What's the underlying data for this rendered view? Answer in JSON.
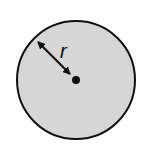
{
  "diagram": {
    "circle": {
      "cx": 76,
      "cy": 80,
      "r": 59,
      "fill": "#d6d6d6",
      "stroke": "#111111"
    },
    "center_dot": {
      "cx": 76,
      "cy": 80,
      "r": 4
    },
    "radius_arrow": {
      "x1": 36,
      "y1": 40,
      "x2": 72,
      "y2": 76
    },
    "radius_label": "r"
  }
}
